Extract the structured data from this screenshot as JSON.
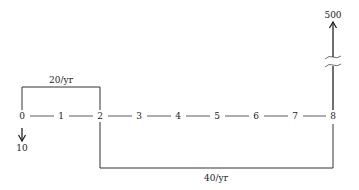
{
  "diagram": {
    "type": "cash-flow-diagram",
    "periods": [
      "0",
      "1",
      "2",
      "3",
      "4",
      "5",
      "6",
      "7",
      "8"
    ],
    "top_bracket": {
      "label": "20/yr",
      "from": 0,
      "to": 2
    },
    "bottom_bracket": {
      "label": "40/yr",
      "from": 2,
      "to": 8
    },
    "outflow_arrow": {
      "label": "10",
      "at": 0,
      "direction": "down"
    },
    "inflow_arrow": {
      "label": "500",
      "at": 8,
      "direction": "up",
      "broken": true
    }
  }
}
